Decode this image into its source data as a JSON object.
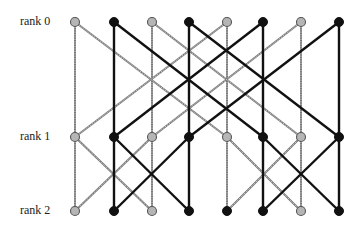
{
  "diagram": {
    "type": "butterfly-network",
    "ranks": [
      {
        "label": "rank 0",
        "y": 22,
        "label_y": 14
      },
      {
        "label": "rank 1",
        "y": 137,
        "label_y": 129
      },
      {
        "label": "rank 2",
        "y": 211,
        "label_y": 203
      }
    ],
    "columns_x": [
      75,
      114,
      152,
      189,
      227,
      263,
      301,
      339
    ],
    "node_colors": [
      [
        "gray",
        "black",
        "gray",
        "black",
        "gray",
        "black",
        "gray",
        "black"
      ],
      [
        "gray",
        "black",
        "gray",
        "black",
        "gray",
        "black",
        "gray",
        "black"
      ],
      [
        "gray",
        "black",
        "gray",
        "black",
        "black",
        "black",
        "gray",
        "black"
      ]
    ],
    "stage_strides": [
      4,
      2
    ],
    "colors": {
      "black": "#111111",
      "gray": "#9a9a9a",
      "gray_fill": "#b5b5b5"
    },
    "node_radius": 4.5,
    "edge_width": {
      "black": 2.4,
      "gray": 2.0
    }
  }
}
